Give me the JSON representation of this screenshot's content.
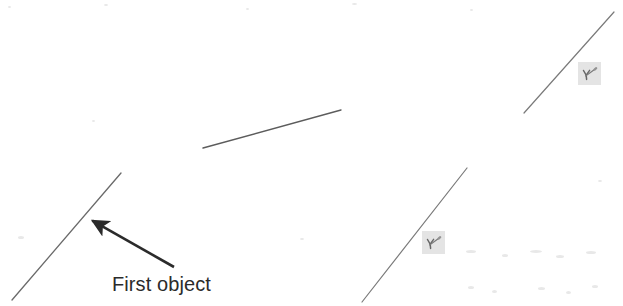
{
  "figure": {
    "canvas": {
      "width": 623,
      "height": 306,
      "background": "#ffffff"
    },
    "ink_color": "#4a4a4a",
    "annotation_color": "#2b2b2b",
    "marker_fill": "#e2e2e2",
    "objects": [
      {
        "name": "first-object-line",
        "description": "lower-left diagonal line segment",
        "x1": 12,
        "y1": 300,
        "x2": 121,
        "y2": 173,
        "stroke": "#6a6a6a",
        "stroke_width": 1.3
      },
      {
        "name": "second-object-line",
        "description": "center short diagonal line segment",
        "x1": 203,
        "y1": 148,
        "x2": 341,
        "y2": 110,
        "stroke": "#5c5c5c",
        "stroke_width": 1.4
      },
      {
        "name": "third-object-line",
        "description": "lower-right diagonal line segment",
        "x1": 362,
        "y1": 302,
        "x2": 467,
        "y2": 168,
        "stroke": "#7a7a7a",
        "stroke_width": 1.2
      },
      {
        "name": "fourth-object-line",
        "description": "upper-right diagonal line segment",
        "x1": 524,
        "y1": 113,
        "x2": 614,
        "y2": 12,
        "stroke": "#7a7a7a",
        "stroke_width": 1.2
      }
    ],
    "callout": {
      "label": "First object",
      "label_x": 112,
      "label_y": 274,
      "arrow": {
        "name": "first-object-arrow",
        "tail_x": 174,
        "tail_y": 267,
        "tip_x": 86,
        "tip_y": 217,
        "stroke": "#2b2b2b",
        "stroke_width": 2.6,
        "head_length": 18,
        "head_width": 11
      }
    },
    "markers": [
      {
        "name": "annotation-marker-lower",
        "glyph": "pen-check-glyph",
        "x": 422,
        "y": 231,
        "size": 23
      },
      {
        "name": "annotation-marker-upper",
        "glyph": "pen-check-glyph",
        "x": 578,
        "y": 62,
        "size": 23
      }
    ],
    "specks": [
      {
        "x": 8,
        "y": 6,
        "w": 3,
        "h": 2
      },
      {
        "x": 104,
        "y": 4,
        "w": 4,
        "h": 2
      },
      {
        "x": 246,
        "y": 8,
        "w": 3,
        "h": 2
      },
      {
        "x": 352,
        "y": 3,
        "w": 5,
        "h": 2
      },
      {
        "x": 470,
        "y": 9,
        "w": 3,
        "h": 2
      },
      {
        "x": 18,
        "y": 236,
        "w": 6,
        "h": 3
      },
      {
        "x": 300,
        "y": 238,
        "w": 4,
        "h": 2
      },
      {
        "x": 466,
        "y": 250,
        "w": 10,
        "h": 3
      },
      {
        "x": 502,
        "y": 254,
        "w": 6,
        "h": 3
      },
      {
        "x": 530,
        "y": 250,
        "w": 12,
        "h": 3
      },
      {
        "x": 556,
        "y": 255,
        "w": 8,
        "h": 3
      },
      {
        "x": 586,
        "y": 251,
        "w": 10,
        "h": 3
      },
      {
        "x": 468,
        "y": 286,
        "w": 6,
        "h": 3
      },
      {
        "x": 492,
        "y": 290,
        "w": 5,
        "h": 3
      },
      {
        "x": 538,
        "y": 287,
        "w": 7,
        "h": 3
      },
      {
        "x": 566,
        "y": 291,
        "w": 5,
        "h": 3
      },
      {
        "x": 592,
        "y": 285,
        "w": 6,
        "h": 3
      },
      {
        "x": 598,
        "y": 180,
        "w": 4,
        "h": 2
      },
      {
        "x": 92,
        "y": 120,
        "w": 3,
        "h": 2
      }
    ]
  }
}
